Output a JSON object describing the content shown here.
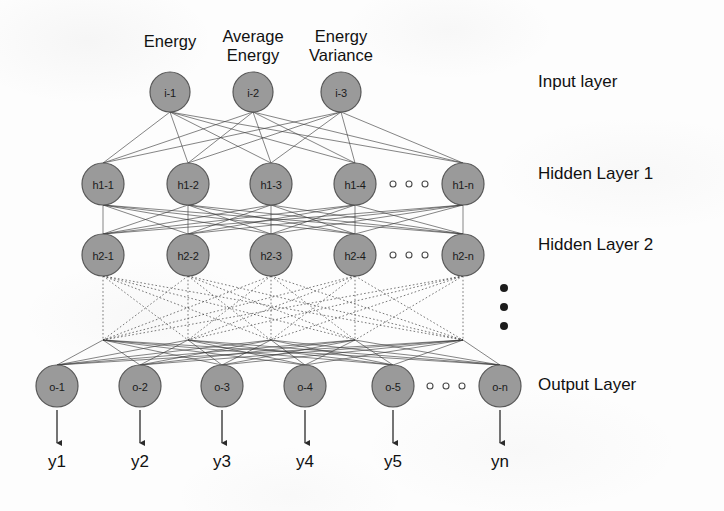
{
  "figure": {
    "background_color": "#fdfdfd",
    "node_fill": "#9a9a9a",
    "node_stroke": "#575757",
    "edge_color": "#3a3a3a"
  },
  "input_captions": [
    {
      "text": "Energy",
      "x": 170
    },
    {
      "text": "Average\nEnergy",
      "x": 253
    },
    {
      "text": "Energy\nVariance",
      "x": 341
    }
  ],
  "layers": [
    {
      "id": "input",
      "caption": "Input layer",
      "caption_x": 538,
      "caption_y": 82,
      "y": 92,
      "radius": 20,
      "nodes": [
        {
          "label": "i-1",
          "x": 170
        },
        {
          "label": "i-2",
          "x": 253
        },
        {
          "label": "i-3",
          "x": 341
        }
      ],
      "ellipsis": null
    },
    {
      "id": "hidden1",
      "caption": "Hidden Layer 1",
      "caption_x": 538,
      "caption_y": 174,
      "y": 184,
      "radius": 21,
      "nodes": [
        {
          "label": "h1-1",
          "x": 103
        },
        {
          "label": "h1-2",
          "x": 188
        },
        {
          "label": "h1-3",
          "x": 271
        },
        {
          "label": "h1-4",
          "x": 355
        },
        {
          "label": "h1-n",
          "x": 463
        }
      ],
      "ellipsis": {
        "x": 409,
        "count": 3,
        "gap": 16,
        "r": 3
      }
    },
    {
      "id": "hidden2",
      "caption": "Hidden Layer 2",
      "caption_x": 538,
      "caption_y": 245,
      "y": 255,
      "radius": 21,
      "nodes": [
        {
          "label": "h2-1",
          "x": 103
        },
        {
          "label": "h2-2",
          "x": 188
        },
        {
          "label": "h2-3",
          "x": 271
        },
        {
          "label": "h2-4",
          "x": 355
        },
        {
          "label": "h2-n",
          "x": 463
        }
      ],
      "ellipsis": {
        "x": 409,
        "count": 3,
        "gap": 16,
        "r": 3
      }
    },
    {
      "id": "output",
      "caption": "Output Layer",
      "caption_x": 538,
      "caption_y": 385,
      "y": 386,
      "radius": 21,
      "nodes": [
        {
          "label": "o-1",
          "x": 57
        },
        {
          "label": "o-2",
          "x": 140
        },
        {
          "label": "o-3",
          "x": 222
        },
        {
          "label": "o-4",
          "x": 305
        },
        {
          "label": "o-5",
          "x": 393
        },
        {
          "label": "o-n",
          "x": 500
        }
      ],
      "ellipsis": {
        "x": 446,
        "count": 3,
        "gap": 16,
        "r": 3
      }
    }
  ],
  "vertical_ellipsis": {
    "x": 504,
    "y_start": 288,
    "count": 3,
    "gap": 19,
    "r": 4
  },
  "junction_row_y": 340,
  "outputs": [
    {
      "label": "y1",
      "x": 57
    },
    {
      "label": "y2",
      "x": 140
    },
    {
      "label": "y3",
      "x": 222
    },
    {
      "label": "y4",
      "x": 305
    },
    {
      "label": "y5",
      "x": 393
    },
    {
      "label": "yn",
      "x": 500
    }
  ],
  "output_arrow": {
    "y_start": 410,
    "y_end": 443,
    "label_y": 452
  }
}
